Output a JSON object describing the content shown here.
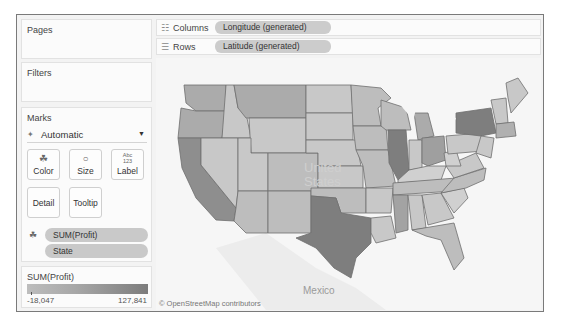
{
  "left_panel": {
    "pages": {
      "title": "Pages"
    },
    "filters": {
      "title": "Filters"
    },
    "marks": {
      "title": "Marks",
      "mark_type": {
        "icon": "automatic-mark-icon",
        "label": "Automatic"
      },
      "buttons": [
        {
          "name": "color",
          "label": "Color",
          "icon": "color-icon"
        },
        {
          "name": "size",
          "label": "Size",
          "icon": "size-icon"
        },
        {
          "name": "label",
          "label": "Label",
          "icon": "label-abc-icon",
          "icon_text": "Abc\n123"
        },
        {
          "name": "detail",
          "label": "Detail"
        },
        {
          "name": "tooltip",
          "label": "Tooltip"
        }
      ],
      "fields": [
        {
          "label": "SUM(Profit)",
          "icon": "color-icon"
        },
        {
          "label": "State"
        }
      ]
    },
    "legend": {
      "title": "SUM(Profit)",
      "min": "-18,047",
      "max": "127,841",
      "color_low": "#bdbdbd",
      "color_high": "#7c7c7c"
    }
  },
  "shelves": {
    "columns": {
      "label": "Columns",
      "icon": "columns-icon",
      "pill": "Longitude (generated)"
    },
    "rows": {
      "label": "Rows",
      "icon": "rows-icon",
      "pill": "Latitude (generated)"
    }
  },
  "map": {
    "country_label_line1": "United",
    "country_label_line2": "States",
    "mexico_label": "Mexico",
    "credit": "© OpenStreetMap contributors",
    "fill_light": "#c8c8c8",
    "fill_mid": "#ababab",
    "fill_dark": "#7e7e7e",
    "border": "#6f6f6f"
  }
}
